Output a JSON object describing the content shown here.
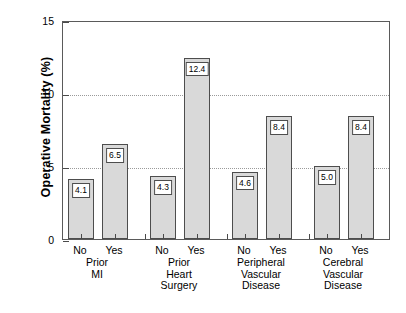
{
  "chart_data": {
    "type": "bar",
    "title": "",
    "xlabel": "",
    "ylabel": "Operative Mortality (%)",
    "ylim": [
      0,
      15
    ],
    "yticks": [
      0,
      5,
      10,
      15
    ],
    "ytick_labels": [
      "0",
      "5",
      "10",
      "15"
    ],
    "gridlines": [
      5,
      10
    ],
    "grid": true,
    "legend": "none",
    "categories": [
      "No",
      "Yes"
    ],
    "groups": [
      {
        "name": [
          "Prior",
          "MI"
        ],
        "bars": [
          {
            "category": "No",
            "value": 4.1,
            "label": "4.1"
          },
          {
            "category": "Yes",
            "value": 6.5,
            "label": "6.5"
          }
        ]
      },
      {
        "name": [
          "Prior",
          "Heart",
          "Surgery"
        ],
        "bars": [
          {
            "category": "No",
            "value": 4.3,
            "label": "4.3"
          },
          {
            "category": "Yes",
            "value": 12.4,
            "label": "12.4"
          }
        ]
      },
      {
        "name": [
          "Peripheral",
          "Vascular",
          "Disease"
        ],
        "bars": [
          {
            "category": "No",
            "value": 4.6,
            "label": "4.6"
          },
          {
            "category": "Yes",
            "value": 8.4,
            "label": "8.4"
          }
        ]
      },
      {
        "name": [
          "Cerebral",
          "Vascular",
          "Disease"
        ],
        "bars": [
          {
            "category": "No",
            "value": 5.0,
            "label": "5.0"
          },
          {
            "category": "Yes",
            "value": 8.4,
            "label": "8.4"
          }
        ]
      }
    ],
    "colors": {
      "bar_fill": "#d9d9d9",
      "bar_edge": "#4d4d4d",
      "axis": "#5a5a5a",
      "grid": "#9a9a9a",
      "text": "#000000",
      "background": "#ffffff"
    }
  }
}
